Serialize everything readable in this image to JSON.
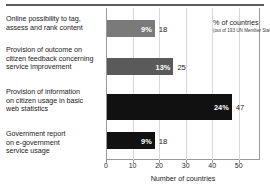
{
  "chart_data": {
    "type": "bar",
    "orientation": "horizontal",
    "title": "",
    "xlabel": "Number of countries",
    "ylabel": "",
    "xlim": [
      0,
      58
    ],
    "xticks": [
      0,
      10,
      20,
      30,
      40,
      50
    ],
    "grid": true,
    "legend_position": "top-right",
    "total_reference": 193,
    "categories": [
      "Online possibility to tag, assess and rank content",
      "Provision of outcome on citizen feedback concerning service improvement",
      "Provision of information on citizen usage in basic web statistics",
      "Government report on e-government service usage"
    ],
    "values": [
      18,
      25,
      47,
      18
    ],
    "percent_labels": [
      "9%",
      "13%",
      "24%",
      "9%"
    ],
    "value_labels": [
      "18",
      "25",
      "47",
      "18"
    ],
    "bar_colors": [
      "#7a7a7a",
      "#5a5a5a",
      "#111111",
      "#111111"
    ],
    "legend": {
      "title": "% of countries",
      "subtitle": "(out of 193 UN Member States)"
    }
  },
  "labels": {
    "cat_0_line_1": "Online possibility to tag,",
    "cat_0_line_2": "assess and rank content",
    "cat_1_line_1": "Provision of outcome on",
    "cat_1_line_2": "citizen feedback concerning",
    "cat_1_line_3": "service improvement",
    "cat_2_line_1": "Provision of information",
    "cat_2_line_2": "on citizen usage in basic",
    "cat_2_line_3": "web statistics",
    "cat_3_line_1": "Government report",
    "cat_3_line_2": "on e-government",
    "cat_3_line_3": "service usage"
  },
  "axis": {
    "tick_0": "0",
    "tick_1": "10",
    "tick_2": "20",
    "tick_3": "30",
    "tick_4": "40",
    "tick_5": "50",
    "title": "Number of countries"
  }
}
